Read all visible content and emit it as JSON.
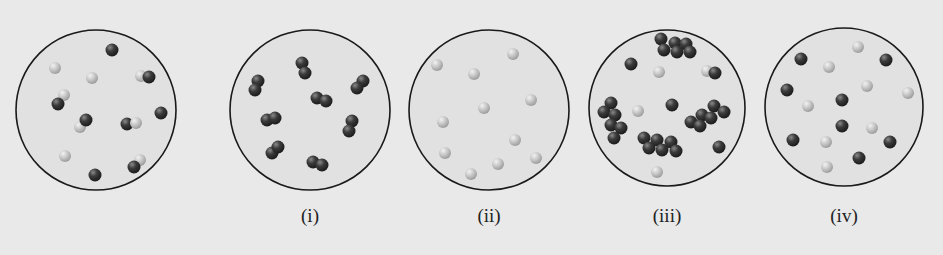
{
  "colors": {
    "background": "#e9e9e9",
    "container_fill": "#e1e1e1",
    "container_stroke": "#1a1a1a",
    "dark_atom": "#3b3b3b",
    "light_atom": "#c9c9c9"
  },
  "panels": [
    {
      "id": "reference",
      "label": "",
      "cx": 96,
      "cy": 110,
      "r": 80,
      "description": "Mixture of dark-light diatomic molecules and single atoms",
      "atoms": [
        {
          "x": 112,
          "y": 50,
          "c": "d"
        },
        {
          "x": 55,
          "y": 68,
          "c": "l"
        },
        {
          "x": 92,
          "y": 78,
          "c": "l"
        },
        {
          "x": 141,
          "y": 76,
          "c": "l"
        },
        {
          "x": 149,
          "y": 77,
          "c": "d"
        },
        {
          "x": 64,
          "y": 95,
          "c": "l"
        },
        {
          "x": 58,
          "y": 104,
          "c": "d"
        },
        {
          "x": 161,
          "y": 113,
          "c": "d"
        },
        {
          "x": 80,
          "y": 127,
          "c": "l"
        },
        {
          "x": 86,
          "y": 120,
          "c": "d"
        },
        {
          "x": 127,
          "y": 124,
          "c": "d"
        },
        {
          "x": 136,
          "y": 123,
          "c": "l"
        },
        {
          "x": 65,
          "y": 156,
          "c": "l"
        },
        {
          "x": 140,
          "y": 160,
          "c": "l"
        },
        {
          "x": 134,
          "y": 167,
          "c": "d"
        },
        {
          "x": 95,
          "y": 175,
          "c": "d"
        }
      ]
    },
    {
      "id": "i",
      "label": "(i)",
      "cx": 310,
      "cy": 110,
      "r": 80,
      "description": "Dark diatomic molecules only",
      "atoms": [
        {
          "x": 302,
          "y": 63,
          "c": "d"
        },
        {
          "x": 305,
          "y": 73,
          "c": "d"
        },
        {
          "x": 258,
          "y": 81,
          "c": "d"
        },
        {
          "x": 255,
          "y": 90,
          "c": "d"
        },
        {
          "x": 363,
          "y": 81,
          "c": "d"
        },
        {
          "x": 357,
          "y": 88,
          "c": "d"
        },
        {
          "x": 317,
          "y": 98,
          "c": "d"
        },
        {
          "x": 326,
          "y": 101,
          "c": "d"
        },
        {
          "x": 267,
          "y": 120,
          "c": "d"
        },
        {
          "x": 275,
          "y": 118,
          "c": "d"
        },
        {
          "x": 352,
          "y": 121,
          "c": "d"
        },
        {
          "x": 349,
          "y": 131,
          "c": "d"
        },
        {
          "x": 272,
          "y": 153,
          "c": "d"
        },
        {
          "x": 278,
          "y": 147,
          "c": "d"
        },
        {
          "x": 313,
          "y": 162,
          "c": "d"
        },
        {
          "x": 322,
          "y": 165,
          "c": "d"
        }
      ]
    },
    {
      "id": "ii",
      "label": "(ii)",
      "cx": 489,
      "cy": 110,
      "r": 80,
      "description": "Light single atoms only",
      "atoms": [
        {
          "x": 513,
          "y": 54,
          "c": "l"
        },
        {
          "x": 437,
          "y": 65,
          "c": "l"
        },
        {
          "x": 474,
          "y": 74,
          "c": "l"
        },
        {
          "x": 531,
          "y": 100,
          "c": "l"
        },
        {
          "x": 484,
          "y": 108,
          "c": "l"
        },
        {
          "x": 443,
          "y": 122,
          "c": "l"
        },
        {
          "x": 515,
          "y": 140,
          "c": "l"
        },
        {
          "x": 445,
          "y": 153,
          "c": "l"
        },
        {
          "x": 536,
          "y": 158,
          "c": "l"
        },
        {
          "x": 498,
          "y": 164,
          "c": "l"
        },
        {
          "x": 471,
          "y": 174,
          "c": "l"
        }
      ]
    },
    {
      "id": "iii",
      "label": "(iii)",
      "cx": 667,
      "cy": 108,
      "r": 78,
      "description": "Dark clusters, dark single atoms and light single atoms",
      "atoms": [
        {
          "x": 661,
          "y": 39,
          "c": "d"
        },
        {
          "x": 675,
          "y": 43,
          "c": "d"
        },
        {
          "x": 686,
          "y": 44,
          "c": "d"
        },
        {
          "x": 664,
          "y": 50,
          "c": "d"
        },
        {
          "x": 677,
          "y": 52,
          "c": "d"
        },
        {
          "x": 690,
          "y": 52,
          "c": "d"
        },
        {
          "x": 631,
          "y": 64,
          "c": "d"
        },
        {
          "x": 659,
          "y": 72,
          "c": "l"
        },
        {
          "x": 707,
          "y": 71,
          "c": "l"
        },
        {
          "x": 715,
          "y": 73,
          "c": "d"
        },
        {
          "x": 611,
          "y": 103,
          "c": "d"
        },
        {
          "x": 604,
          "y": 112,
          "c": "d"
        },
        {
          "x": 615,
          "y": 115,
          "c": "d"
        },
        {
          "x": 611,
          "y": 125,
          "c": "d"
        },
        {
          "x": 621,
          "y": 128,
          "c": "d"
        },
        {
          "x": 614,
          "y": 138,
          "c": "d"
        },
        {
          "x": 638,
          "y": 111,
          "c": "l"
        },
        {
          "x": 672,
          "y": 105,
          "c": "d"
        },
        {
          "x": 714,
          "y": 106,
          "c": "d"
        },
        {
          "x": 724,
          "y": 112,
          "c": "d"
        },
        {
          "x": 702,
          "y": 115,
          "c": "d"
        },
        {
          "x": 711,
          "y": 118,
          "c": "d"
        },
        {
          "x": 691,
          "y": 122,
          "c": "d"
        },
        {
          "x": 700,
          "y": 126,
          "c": "d"
        },
        {
          "x": 644,
          "y": 138,
          "c": "d"
        },
        {
          "x": 657,
          "y": 140,
          "c": "d"
        },
        {
          "x": 671,
          "y": 142,
          "c": "d"
        },
        {
          "x": 649,
          "y": 148,
          "c": "d"
        },
        {
          "x": 662,
          "y": 150,
          "c": "d"
        },
        {
          "x": 676,
          "y": 151,
          "c": "d"
        },
        {
          "x": 719,
          "y": 147,
          "c": "d"
        },
        {
          "x": 657,
          "y": 172,
          "c": "l"
        }
      ]
    },
    {
      "id": "iv",
      "label": "(iv)",
      "cx": 844,
      "cy": 107,
      "r": 79,
      "description": "Dark single atoms and light single atoms",
      "atoms": [
        {
          "x": 858,
          "y": 47,
          "c": "l"
        },
        {
          "x": 801,
          "y": 59,
          "c": "d"
        },
        {
          "x": 886,
          "y": 60,
          "c": "d"
        },
        {
          "x": 829,
          "y": 67,
          "c": "l"
        },
        {
          "x": 787,
          "y": 90,
          "c": "d"
        },
        {
          "x": 867,
          "y": 86,
          "c": "l"
        },
        {
          "x": 908,
          "y": 93,
          "c": "l"
        },
        {
          "x": 842,
          "y": 100,
          "c": "d"
        },
        {
          "x": 808,
          "y": 106,
          "c": "l"
        },
        {
          "x": 842,
          "y": 126,
          "c": "d"
        },
        {
          "x": 872,
          "y": 128,
          "c": "l"
        },
        {
          "x": 793,
          "y": 140,
          "c": "d"
        },
        {
          "x": 826,
          "y": 142,
          "c": "l"
        },
        {
          "x": 890,
          "y": 142,
          "c": "d"
        },
        {
          "x": 859,
          "y": 158,
          "c": "d"
        },
        {
          "x": 827,
          "y": 167,
          "c": "l"
        }
      ]
    }
  ],
  "labels": [
    {
      "text": "(i)",
      "x": 310,
      "y": 205
    },
    {
      "text": "(ii)",
      "x": 489,
      "y": 205
    },
    {
      "text": "(iii)",
      "x": 667,
      "y": 205
    },
    {
      "text": "(iv)",
      "x": 844,
      "y": 205
    }
  ]
}
